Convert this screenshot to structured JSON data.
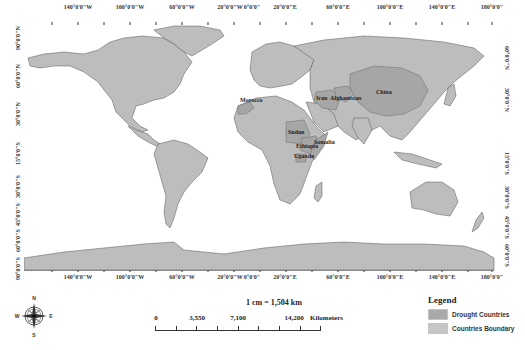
{
  "map": {
    "title": "",
    "longitude_labels": [
      "140°0'0\"W",
      "100°0'0\"W",
      "60°0'0\"W",
      "20°0'0\"W",
      "0°0'0\"",
      "20°0'0\"E",
      "60°0'0\"E",
      "100°0'0\"E",
      "140°0'0\"E",
      "180°0'0\""
    ],
    "latitude_labels_left": [
      "90°0'0\"N",
      "60°0'0\"N",
      "30°0'0\"N",
      "0°0'0\"",
      "15°0'0\"S",
      "30°0'0\"S",
      "45°0'0\"S",
      "60°0'0\"S",
      "90°0'0\"S"
    ],
    "latitude_labels_right": [
      "60°0'0\"N",
      "30°0'0\"N",
      "15°0'0\"S",
      "30°0'0\"S",
      "45°0'0\"S",
      "60°0'0\"S"
    ],
    "drought_country_labels": [
      "Morocco",
      "Iran",
      "Afghanistan",
      "China",
      "Sudan",
      "Ethiopia",
      "Somalia",
      "Uganda"
    ],
    "colors": {
      "ocean": "#ffffff",
      "land": "#bdbdbd",
      "drought": "#a6a6a6",
      "border": "#7a7a7a",
      "coast": "#444444"
    }
  },
  "scale": {
    "ratio": "1 cm = 1,504 km",
    "ticks": [
      "0",
      "3,550",
      "7,100",
      "14,200"
    ],
    "unit": "Kilometers"
  },
  "legend": {
    "title": "Legend",
    "items": [
      {
        "label": "Drought Countries",
        "color": "#a9a9a9"
      },
      {
        "label": "Countries Boundary",
        "color": "#c6c6c6"
      }
    ]
  },
  "compass": {
    "n": "N",
    "s": "S",
    "e": "E",
    "w": "W"
  }
}
